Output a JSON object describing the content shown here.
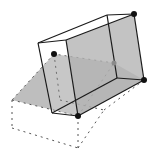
{
  "diagram": {
    "colors": {
      "background": "#ffffff",
      "solid_edge": "#1a1a1a",
      "dashed_edge": "#555555",
      "plane_fill": "#a8a8a8",
      "box_face_fill": "#b4b4b4",
      "vertex_dot": "#111111",
      "hidden_dot": "#8a8a8a"
    },
    "solid_box": {
      "vertices": {
        "front_top_left": [
          38,
          43
        ],
        "front_top_right": [
          66,
          40
        ],
        "back_top_left": [
          107,
          15
        ],
        "back_top_right": [
          134,
          14
        ],
        "front_bottom_left": [
          52,
          113
        ],
        "front_bottom_right": [
          78,
          116
        ],
        "back_bottom_right": [
          144,
          80
        ],
        "back_bottom_inner": [
          117,
          78
        ]
      }
    },
    "shaded_plane": {
      "points": [
        [
          54,
          54
        ],
        [
          114,
          63
        ],
        [
          144,
          80
        ],
        [
          78,
          116
        ],
        [
          12,
          100
        ]
      ]
    },
    "dashed_box": {
      "points_top": [
        [
          54,
          54
        ],
        [
          12,
          100
        ],
        [
          78,
          116
        ],
        [
          114,
          63
        ]
      ],
      "points_bottom": [
        [
          12,
          128
        ],
        [
          78,
          148
        ],
        [
          104,
          110
        ]
      ]
    },
    "dots": [
      {
        "name": "top-right-vertex",
        "pos": [
          134,
          14
        ],
        "kind": "solid"
      },
      {
        "name": "right-vertex",
        "pos": [
          144,
          80
        ],
        "kind": "solid"
      },
      {
        "name": "bottom-vertex",
        "pos": [
          78,
          116
        ],
        "kind": "solid"
      },
      {
        "name": "left-hinge-vertex",
        "pos": [
          54,
          54
        ],
        "kind": "solid"
      },
      {
        "name": "hidden-vertex",
        "pos": [
          114,
          63
        ],
        "kind": "hidden"
      }
    ]
  }
}
